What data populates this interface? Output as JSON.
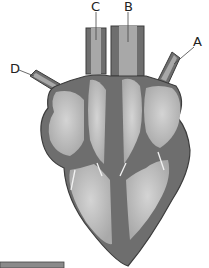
{
  "diagram": {
    "labels": [
      {
        "id": "A",
        "text": "A",
        "x": 193,
        "y": 35
      },
      {
        "id": "B",
        "text": "B",
        "x": 124,
        "y": 0
      },
      {
        "id": "C",
        "text": "C",
        "x": 91,
        "y": 0
      },
      {
        "id": "D",
        "text": "D",
        "x": 10,
        "y": 62
      }
    ],
    "colors": {
      "wall": "#6e6e6e",
      "outline": "#3c3c3c",
      "chamber": "#bdbdbd",
      "vessel": "#a8a8a8",
      "bar": "#8a8a8a"
    }
  }
}
